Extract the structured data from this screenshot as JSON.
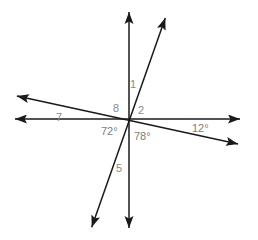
{
  "figure": {
    "type": "geometry-diagram",
    "width": 258,
    "height": 240,
    "background_color": "#ffffff",
    "line_color": "#1a1a1a",
    "label_color": "#8a8a8a",
    "vertex": {
      "x": 129,
      "y": 119
    },
    "lines": [
      {
        "name": "vertical-line",
        "x1": 129,
        "y1": 7,
        "x2": 129,
        "y2": 233,
        "arrow_start": true,
        "arrow_end": true
      },
      {
        "name": "horizontal-line",
        "x1": 10,
        "y1": 119,
        "x2": 245,
        "y2": 119,
        "arrow_start": true,
        "arrow_end": true
      },
      {
        "name": "steep-diagonal-line",
        "x1": 167,
        "y1": 13,
        "x2": 90,
        "y2": 232,
        "arrow_start": true,
        "arrow_end": true
      },
      {
        "name": "shallow-diagonal-line",
        "x1": 12,
        "y1": 95,
        "x2": 243,
        "y2": 145,
        "arrow_start": true,
        "arrow_end": true
      }
    ],
    "labels": [
      {
        "name": "angle-label-1",
        "text": "1",
        "x": 130,
        "y": 79
      },
      {
        "name": "angle-label-8",
        "text": "8",
        "x": 113,
        "y": 103
      },
      {
        "name": "angle-label-2",
        "text": "2",
        "x": 138,
        "y": 105
      },
      {
        "name": "angle-label-7",
        "text": "7",
        "x": 56,
        "y": 112
      },
      {
        "name": "angle-label-12deg",
        "text": "12°",
        "x": 192,
        "y": 123
      },
      {
        "name": "angle-label-72deg",
        "text": "72°",
        "x": 101,
        "y": 126
      },
      {
        "name": "angle-label-78deg",
        "text": "78°",
        "x": 134,
        "y": 131
      },
      {
        "name": "angle-label-5",
        "text": "5",
        "x": 116,
        "y": 163
      }
    ]
  }
}
